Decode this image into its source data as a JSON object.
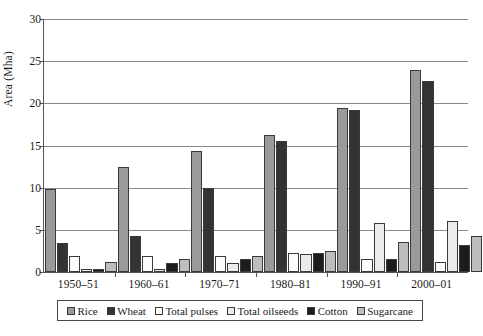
{
  "chart_data": {
    "type": "bar",
    "title": "",
    "xlabel": "",
    "ylabel": "Area (Mha)",
    "ylim": [
      0,
      30
    ],
    "yticks": [
      0,
      5,
      10,
      15,
      20,
      25,
      30
    ],
    "grid": true,
    "legend_position": "bottom",
    "categories": [
      "1950–51",
      "1960–61",
      "1970–71",
      "1980–81",
      "1990–91",
      "2000–01"
    ],
    "series": [
      {
        "name": "Rice",
        "color": "#9a9a9a",
        "values": [
          9.8,
          12.5,
          14.3,
          16.3,
          19.5,
          24.0
        ]
      },
      {
        "name": "Wheat",
        "color": "#333333",
        "values": [
          3.4,
          4.3,
          10.0,
          15.5,
          19.2,
          22.6
        ]
      },
      {
        "name": "Total pulses",
        "color": "#fdfdfd",
        "values": [
          1.9,
          1.9,
          1.9,
          2.2,
          1.5,
          1.2
        ]
      },
      {
        "name": "Total oilseeds",
        "color": "#ebebeb",
        "values": [
          0.3,
          0.3,
          1.1,
          2.1,
          5.8,
          6.0
        ]
      },
      {
        "name": "Cotton",
        "color": "#1c1c1c",
        "values": [
          0.4,
          1.1,
          1.5,
          2.2,
          1.5,
          3.2
        ]
      },
      {
        "name": "Sugarcane",
        "color": "#bdbdbd",
        "values": [
          1.2,
          1.6,
          1.9,
          2.5,
          3.5,
          4.3
        ]
      }
    ]
  },
  "axis": {
    "y_title": "Area (Mha)"
  }
}
